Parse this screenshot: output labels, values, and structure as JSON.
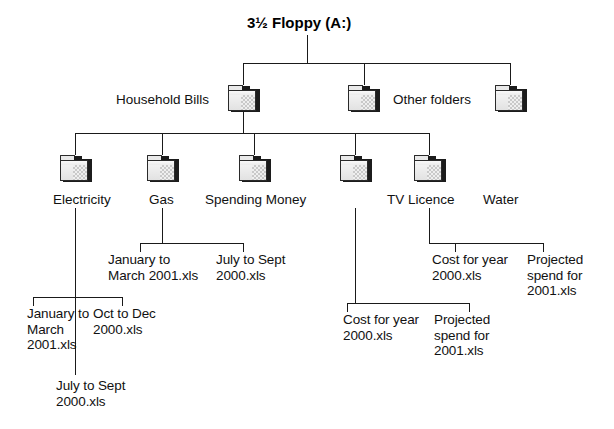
{
  "diagram": {
    "type": "folder-tree",
    "root": {
      "title": "3½ Floppy (A:)"
    },
    "level2": [
      {
        "label": "Household Bills",
        "label_side": "left"
      },
      {
        "label": "Other folders",
        "label_side": "right"
      },
      {
        "label": "",
        "label_side": "none"
      }
    ],
    "level3": [
      {
        "label": "Electricity"
      },
      {
        "label": "Gas"
      },
      {
        "label": "Spending Money"
      },
      {
        "label": "TV Licence"
      },
      {
        "label": "Water"
      }
    ],
    "files": {
      "electricity": [
        "January to\nMarch\n2001.xls",
        "Oct to Dec\n2000.xls",
        "July to Sept\n2000.xls"
      ],
      "gas": [
        "January to\nMarch 2001.xls",
        "July to Sept\n2000.xls"
      ],
      "tv_licence": [
        "Cost for year\n2000.xls",
        "Projected\nspend for\n2001.xls"
      ],
      "water": [
        "Cost for year\n2000.xls",
        "Projected\nspend for\n2001.xls"
      ]
    },
    "colors": {
      "line": "#1a1a1a",
      "text": "#111111",
      "folder_face": "#e2e2e2",
      "folder_outline": "#2a2a2a",
      "folder_shadow": "#1c1c1c",
      "background": "#ffffff"
    }
  }
}
